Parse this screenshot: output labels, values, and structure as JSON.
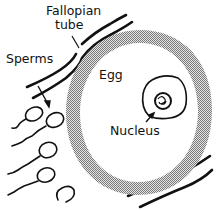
{
  "diagram": {
    "labels": {
      "fallopian_line1": "Fallopian",
      "fallopian_line2": "tube",
      "sperms": "Sperms",
      "egg": "Egg",
      "nucleus": "Nucleus"
    },
    "colors": {
      "ink": "#111111",
      "zona_pellucida": "#a8a8a8",
      "background": "#ffffff"
    },
    "elements": {
      "sperm_count": 5
    }
  }
}
